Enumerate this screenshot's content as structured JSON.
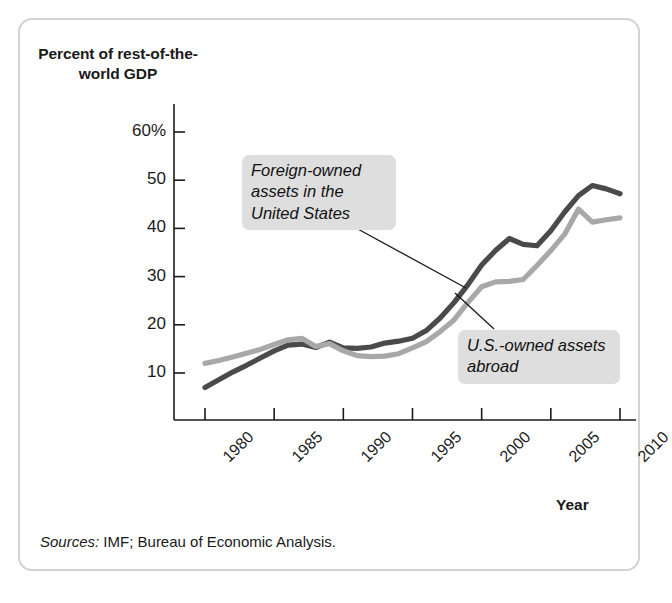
{
  "figure": {
    "frame_border_color": "#d3d3d3",
    "background": "#ffffff"
  },
  "axis_title_y": "Percent of rest-of-the-world GDP",
  "axis_title_x": "Year",
  "callouts": {
    "foreign_owned": "Foreign-owned assets in the United States",
    "us_owned": "U.S.-owned assets abroad"
  },
  "source_note": {
    "label": "Sources:",
    "text": " IMF; Bureau of Economic Analysis."
  },
  "chart_data": {
    "type": "line",
    "title": "",
    "xlabel": "Year",
    "ylabel": "Percent of rest-of-the-world GDP",
    "xlim": [
      1980,
      2010
    ],
    "ylim": [
      0,
      60
    ],
    "yticks": [
      10,
      20,
      30,
      40,
      50,
      60
    ],
    "ytick_labels": [
      "10",
      "20",
      "30",
      "40",
      "50",
      "60%"
    ],
    "xticks": [
      1980,
      1985,
      1990,
      1995,
      2000,
      2005,
      2010
    ],
    "xtick_labels": [
      "1980",
      "1985",
      "1990",
      "1995",
      "2000",
      "2005",
      "2010"
    ],
    "grid": false,
    "legend": "annotations",
    "x": [
      1980,
      1981,
      1982,
      1983,
      1984,
      1985,
      1986,
      1987,
      1988,
      1989,
      1990,
      1991,
      1992,
      1993,
      1994,
      1995,
      1996,
      1997,
      1998,
      1999,
      2000,
      2001,
      2002,
      2003,
      2004,
      2005,
      2006,
      2007,
      2008,
      2009,
      2010
    ],
    "series": [
      {
        "name": "Foreign-owned assets in the United States",
        "color": "#4a4a4a",
        "values": [
          7.0,
          8.6,
          10.2,
          11.6,
          13.1,
          14.6,
          15.8,
          16.0,
          15.3,
          16.4,
          15.2,
          15.1,
          15.4,
          16.2,
          16.6,
          17.2,
          18.8,
          21.4,
          24.6,
          28.3,
          32.4,
          35.4,
          37.9,
          36.7,
          36.4,
          39.5,
          43.4,
          46.8,
          48.9,
          48.2,
          47.2
        ]
      },
      {
        "name": "U.S.-owned assets abroad",
        "color": "#a8a8a8",
        "values": [
          12.0,
          12.6,
          13.3,
          14.1,
          14.9,
          15.9,
          16.9,
          17.2,
          15.5,
          16.1,
          14.6,
          13.6,
          13.4,
          13.5,
          14.0,
          15.2,
          16.5,
          18.6,
          21.0,
          24.6,
          27.9,
          28.9,
          29.0,
          29.4,
          32.3,
          35.4,
          38.8,
          44.0,
          41.3,
          41.8,
          42.2
        ]
      }
    ]
  }
}
